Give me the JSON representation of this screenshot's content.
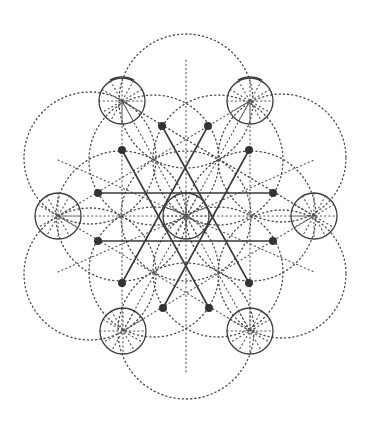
{
  "diagram": {
    "type": "sacred-geometry",
    "center": [
      186,
      216
    ],
    "colors": {
      "stroke": "#3d3d3d",
      "dotted": "#4a4a4a",
      "node": "#333333",
      "background": "#ffffff"
    },
    "outer_small_circles": [
      {
        "cx": 122,
        "cy": 101,
        "r": 23,
        "cap": true
      },
      {
        "cx": 250,
        "cy": 101,
        "r": 23,
        "cap": true
      },
      {
        "cx": 58,
        "cy": 216,
        "r": 23,
        "cap": false
      },
      {
        "cx": 314,
        "cy": 216,
        "r": 23,
        "cap": false
      },
      {
        "cx": 123,
        "cy": 331,
        "r": 23,
        "cap": false
      },
      {
        "cx": 250,
        "cy": 331,
        "r": 23,
        "cap": false
      }
    ],
    "center_small_circle": {
      "cx": 186,
      "cy": 216,
      "r": 23
    },
    "large_dotted_circles": [
      {
        "cx": 186,
        "cy": 101,
        "r": 67
      },
      {
        "cx": 90,
        "cy": 158,
        "r": 66
      },
      {
        "cx": 282,
        "cy": 158,
        "r": 64
      },
      {
        "cx": 90,
        "cy": 274,
        "r": 66
      },
      {
        "cx": 282,
        "cy": 274,
        "r": 64
      },
      {
        "cx": 186,
        "cy": 331,
        "r": 68
      }
    ],
    "inner_dotted_circles": [
      {
        "cx": 186,
        "cy": 216,
        "r": 65
      },
      {
        "cx": 154,
        "cy": 160,
        "r": 65
      },
      {
        "cx": 218,
        "cy": 160,
        "r": 65
      },
      {
        "cx": 121,
        "cy": 216,
        "r": 65
      },
      {
        "cx": 251,
        "cy": 216,
        "r": 65
      },
      {
        "cx": 154,
        "cy": 272,
        "r": 65
      },
      {
        "cx": 218,
        "cy": 272,
        "r": 65
      }
    ],
    "nodes": [
      [
        162,
        126
      ],
      [
        208,
        126
      ],
      [
        122,
        150
      ],
      [
        249,
        150
      ],
      [
        98,
        193
      ],
      [
        273,
        193
      ],
      [
        98,
        241
      ],
      [
        273,
        241
      ],
      [
        122,
        283
      ],
      [
        249,
        283
      ],
      [
        163,
        308
      ],
      [
        209,
        308
      ]
    ],
    "solid_lines": [
      [
        [
          98,
          193
        ],
        [
          273,
          193
        ]
      ],
      [
        [
          98,
          241
        ],
        [
          273,
          241
        ]
      ],
      [
        [
          122,
          150
        ],
        [
          209,
          308
        ]
      ],
      [
        [
          162,
          126
        ],
        [
          249,
          283
        ]
      ],
      [
        [
          208,
          126
        ],
        [
          122,
          283
        ]
      ],
      [
        [
          249,
          150
        ],
        [
          163,
          308
        ]
      ]
    ],
    "spoke_length": 23,
    "spoke_angles": [
      0,
      30,
      60,
      90,
      120,
      150
    ],
    "grid_lines": [
      [
        [
          58,
          216
        ],
        [
          314,
          216
        ]
      ],
      [
        [
          122,
          101
        ],
        [
          250,
          331
        ]
      ],
      [
        [
          250,
          101
        ],
        [
          123,
          331
        ]
      ],
      [
        [
          122,
          101
        ],
        [
          122,
          331
        ]
      ],
      [
        [
          250,
          101
        ],
        [
          250,
          331
        ]
      ],
      [
        [
          186,
          60
        ],
        [
          186,
          372
        ]
      ],
      [
        [
          58,
          216
        ],
        [
          250,
          101
        ]
      ],
      [
        [
          58,
          216
        ],
        [
          250,
          331
        ]
      ],
      [
        [
          314,
          216
        ],
        [
          122,
          101
        ]
      ],
      [
        [
          314,
          216
        ],
        [
          123,
          331
        ]
      ],
      [
        [
          122,
          101
        ],
        [
          314,
          216
        ]
      ],
      [
        [
          58,
          160
        ],
        [
          314,
          272
        ]
      ],
      [
        [
          58,
          272
        ],
        [
          314,
          160
        ]
      ]
    ]
  }
}
